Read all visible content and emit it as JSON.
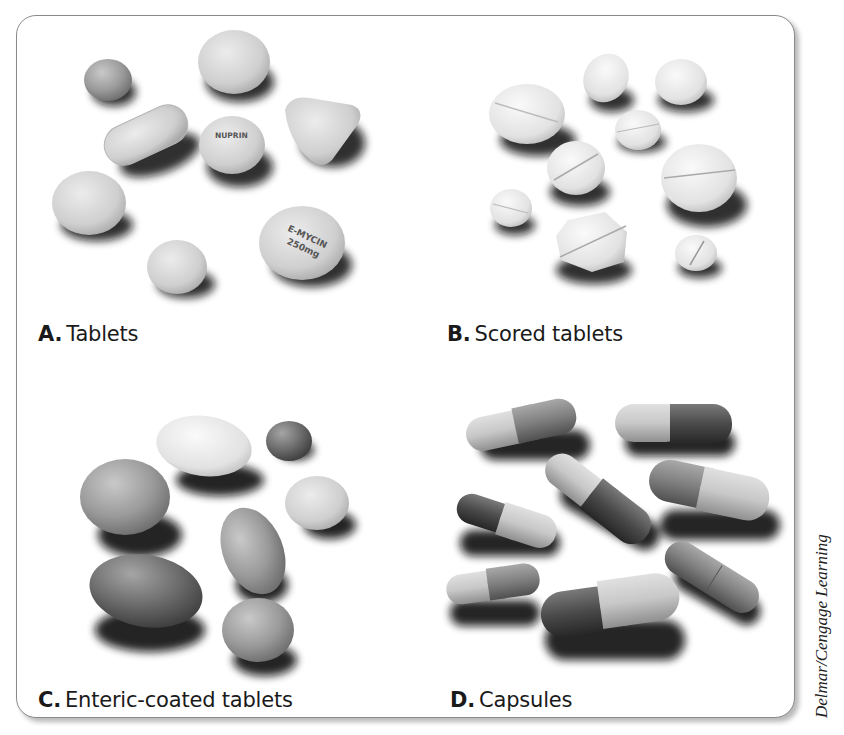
{
  "figure": {
    "panels": [
      {
        "id": "A",
        "letter": "A.",
        "caption": "Tablets",
        "imprints": [
          "NUPRIN",
          "E-MYCIN",
          "250mg"
        ]
      },
      {
        "id": "B",
        "letter": "B.",
        "caption": "Scored tablets"
      },
      {
        "id": "C",
        "letter": "C.",
        "caption": "Enteric-coated tablets"
      },
      {
        "id": "D",
        "letter": "D.",
        "caption": "Capsules"
      }
    ],
    "credit": "Delmar/Cengage Learning"
  }
}
